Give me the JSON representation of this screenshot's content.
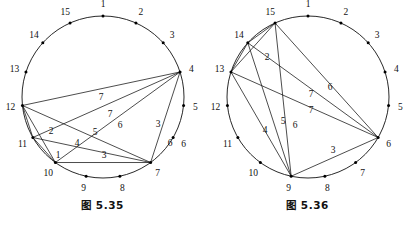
{
  "figures": [
    {
      "id": "fig-5-35",
      "caption": "图 5.35",
      "circle": {
        "cx": 103,
        "cy": 97,
        "r": 81
      },
      "point_count": 15,
      "node_labels": [
        "1",
        "2",
        "3",
        "4",
        "5",
        "6",
        "7",
        "8",
        "9",
        "10",
        "11",
        "12",
        "13",
        "14",
        "15"
      ],
      "edge_labels": [
        {
          "text": "7",
          "x": 101,
          "y": 100
        },
        {
          "text": "7",
          "x": 110,
          "y": 117
        },
        {
          "text": "6",
          "x": 120,
          "y": 128
        },
        {
          "text": "5",
          "x": 95,
          "y": 135
        },
        {
          "text": "4",
          "x": 77,
          "y": 146
        },
        {
          "text": "3",
          "x": 104,
          "y": 158
        },
        {
          "text": "3",
          "x": 158,
          "y": 127
        },
        {
          "text": "6",
          "x": 170,
          "y": 146
        },
        {
          "text": "2",
          "x": 51,
          "y": 134
        },
        {
          "text": "1",
          "x": 58,
          "y": 158
        }
      ],
      "chords": [
        {
          "from": 12,
          "to": 4,
          "label": "7"
        },
        {
          "from": 11,
          "to": 4,
          "label": "7"
        },
        {
          "from": 10,
          "to": 4,
          "label": "6"
        },
        {
          "from": 12,
          "to": 7,
          "label": "5"
        },
        {
          "from": 12,
          "to": 10,
          "label": "2"
        },
        {
          "from": 11,
          "to": 10,
          "label": "1"
        },
        {
          "from": 11,
          "to": 7,
          "label": "4"
        },
        {
          "from": 10,
          "to": 7,
          "label": "3"
        },
        {
          "from": 4,
          "to": 7,
          "label": "3"
        },
        {
          "from": 12,
          "to": 11,
          "label": "1"
        }
      ]
    },
    {
      "id": "fig-5-36",
      "caption": "图 5.36",
      "circle": {
        "cx": 103,
        "cy": 97,
        "r": 81
      },
      "point_count": 15,
      "node_labels": [
        "1",
        "2",
        "3",
        "4",
        "5",
        "6",
        "7",
        "8",
        "9",
        "10",
        "11",
        "12",
        "13",
        "14",
        "15"
      ],
      "edge_labels": [
        {
          "text": "6",
          "x": 125,
          "y": 90
        },
        {
          "text": "7",
          "x": 106,
          "y": 97
        },
        {
          "text": "7",
          "x": 106,
          "y": 113
        },
        {
          "text": "5",
          "x": 78,
          "y": 124
        },
        {
          "text": "6",
          "x": 90,
          "y": 128
        },
        {
          "text": "4",
          "x": 60,
          "y": 133
        },
        {
          "text": "3",
          "x": 128,
          "y": 153
        },
        {
          "text": "2",
          "x": 62,
          "y": 60
        }
      ],
      "chords": [
        {
          "from": 15,
          "to": 6,
          "label": "6"
        },
        {
          "from": 14,
          "to": 6,
          "label": "7"
        },
        {
          "from": 13,
          "to": 6,
          "label": "7"
        },
        {
          "from": 13,
          "to": 9,
          "label": "4"
        },
        {
          "from": 14,
          "to": 9,
          "label": "5"
        },
        {
          "from": 15,
          "to": 9,
          "label": "6"
        },
        {
          "from": 9,
          "to": 6,
          "label": "3"
        },
        {
          "from": 15,
          "to": 13,
          "label": "2"
        },
        {
          "from": 15,
          "to": 14,
          "label": "1"
        },
        {
          "from": 14,
          "to": 13,
          "label": "1"
        }
      ]
    }
  ]
}
